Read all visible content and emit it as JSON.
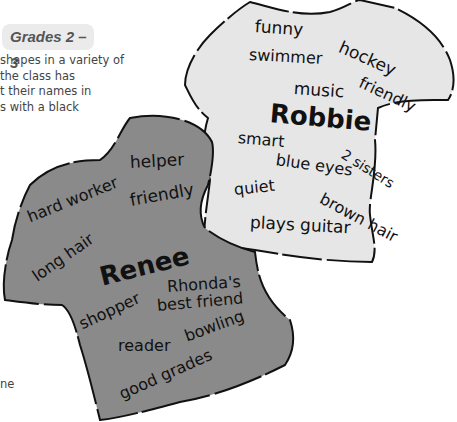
{
  "header": {
    "grade_badge": "Grades 2 – 3"
  },
  "body_text": {
    "lines": [
      "shapes in a variety of",
      "the class has",
      "t their names in",
      "s with a black"
    ],
    "stray_fragment": "ne"
  },
  "shirts": {
    "robbie": {
      "color": "#e6e6e6",
      "name": "Robbie",
      "words": {
        "funny": "funny",
        "hockey": "hockey",
        "swimmer": "swimmer",
        "friendly": "friendly",
        "music": "music",
        "smart": "smart",
        "sisters": "2 sisters",
        "blue_eyes": "blue eyes",
        "quiet": "quiet",
        "brown_hair": "brown hair",
        "plays_guitar": "plays guitar"
      }
    },
    "renee": {
      "color": "#8a8a8a",
      "name": "Renee",
      "words": {
        "helper": "helper",
        "hard_worker": "hard worker",
        "friendly": "friendly",
        "long_hair": "long hair",
        "rhondas": "Rhonda's",
        "best_friend": "best friend",
        "shopper": "shopper",
        "reader": "reader",
        "bowling": "bowling",
        "good_grades": "good grades"
      }
    }
  }
}
